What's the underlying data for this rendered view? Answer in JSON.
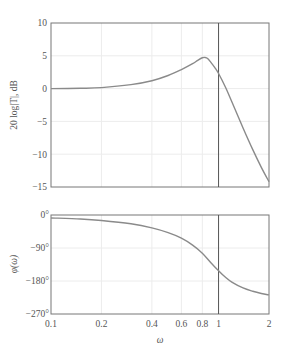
{
  "chart_data": [
    {
      "type": "line",
      "title": "",
      "xlabel": "",
      "ylabel": "20 log|T|, dB",
      "xscale": "log",
      "xlim": [
        0.1,
        2
      ],
      "ylim": [
        -15,
        10
      ],
      "grid": true,
      "xticks": [
        0.1,
        0.2,
        0.4,
        0.6,
        0.8,
        1,
        2
      ],
      "yticks": [
        10,
        5,
        0,
        -5,
        -10,
        -15
      ],
      "ytick_labels": [
        "10",
        "5",
        "0",
        "−5",
        "−10",
        "−15"
      ],
      "vertical_line_x": 1,
      "series": [
        {
          "name": "magnitude",
          "x": [
            0.1,
            0.15,
            0.2,
            0.3,
            0.4,
            0.5,
            0.6,
            0.7,
            0.75,
            0.8,
            0.83,
            0.86,
            0.9,
            0.95,
            1.0,
            1.1,
            1.2,
            1.4,
            1.6,
            1.8,
            2.0
          ],
          "values": [
            0.0,
            0.05,
            0.15,
            0.6,
            1.2,
            2.0,
            2.9,
            3.8,
            4.3,
            4.7,
            4.75,
            4.6,
            4.0,
            3.2,
            2.3,
            0.2,
            -2.0,
            -6.0,
            -9.3,
            -12.0,
            -14.2
          ]
        }
      ]
    },
    {
      "type": "line",
      "title": "",
      "xlabel": "ω",
      "ylabel": "φ(ω)",
      "xscale": "log",
      "xlim": [
        0.1,
        2
      ],
      "ylim": [
        -270,
        0
      ],
      "grid": true,
      "xticks": [
        0.1,
        0.2,
        0.4,
        0.6,
        0.8,
        1,
        2
      ],
      "xtick_labels": [
        "0.1",
        "0.2",
        "0.4",
        "0.6",
        "0.8",
        "1",
        "2"
      ],
      "yticks": [
        0,
        -90,
        -180,
        -270
      ],
      "ytick_labels": [
        "0°",
        "−90°",
        "−180°",
        "−270°"
      ],
      "vertical_line_x": 1,
      "series": [
        {
          "name": "phase",
          "x": [
            0.1,
            0.15,
            0.2,
            0.3,
            0.4,
            0.5,
            0.6,
            0.7,
            0.8,
            0.9,
            1.0,
            1.1,
            1.2,
            1.4,
            1.6,
            1.8,
            2.0
          ],
          "values": [
            -8,
            -11,
            -15,
            -24,
            -35,
            -48,
            -63,
            -82,
            -104,
            -130,
            -152,
            -170,
            -183,
            -199,
            -208,
            -214,
            -218
          ]
        }
      ]
    }
  ],
  "labels": {
    "mag_ylabel": "20 log|T|, dB",
    "phase_ylabel": "φ(ω)",
    "xlabel": "ω",
    "mag_yticks": [
      "10",
      "5",
      "0",
      "−5",
      "−10",
      "−15"
    ],
    "phase_yticks": [
      "0°",
      "−90°",
      "−180°",
      "−270°"
    ],
    "xticks": [
      "0.1",
      "0.2",
      "0.4",
      "0.6",
      "0.8",
      "1",
      "2"
    ]
  }
}
